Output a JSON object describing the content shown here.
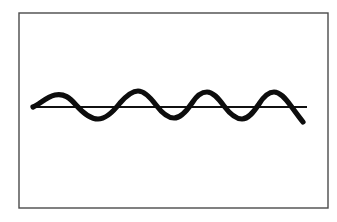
{
  "figure": {
    "title": "Sinusoidal wave crossing a horizontal axis",
    "caption": "",
    "background_color": "#ffffff"
  },
  "frame": {
    "name": "figure-border",
    "x": 19,
    "y": 13,
    "width": 309,
    "height": 195,
    "stroke_color": "#4a4a4a",
    "stroke_width": 1.4,
    "fill_color": "#ffffff"
  },
  "axis": {
    "name": "horizontal-baseline",
    "x_start": 33,
    "x_end": 307,
    "y": 107,
    "stroke_color": "#111111",
    "stroke_width": 2.2
  },
  "wave": {
    "name": "sine-wave-curve",
    "stroke_color": "#0d0d0d",
    "stroke_width": 5.2,
    "start_x": 33,
    "end_x": 303,
    "baseline_y": 107,
    "cycles": 4,
    "crest_count": 4,
    "trough_count": 4,
    "path": "M 33 107 C 40 104 46 97 55 95 C 64 93 70 98 76 105 C 83 113 90 119 98 119 C 106 119 113 112 120 103 C 127 95 132 91 138 91 C 144 91 150 97 156 105 C 162 113 168 118 174 118 C 180 118 186 112 192 103 C 197 95 202 92 207 92 C 213 92 218 98 224 106 C 230 114 236 119 242 119 C 248 119 253 113 259 104 C 264 96 269 92 274 92 C 280 92 285 98 291 106 C 296 113 300 118 303 122"
  },
  "chart_data": {
    "type": "line",
    "title": "Sinusoidal wave crossing a horizontal axis",
    "xlabel": "",
    "ylabel": "",
    "grid": false,
    "legend": "none",
    "xlim": [
      0,
      4.2
    ],
    "ylim": [
      -1.2,
      1.2
    ],
    "series": [
      {
        "name": "baseline",
        "style": "straight-line",
        "points": [
          {
            "x": 0.0,
            "y": 0
          },
          {
            "x": 4.2,
            "y": 0
          }
        ]
      },
      {
        "name": "wave",
        "style": "thick-freehand-sine",
        "crests": [
          {
            "x": 0.33,
            "y": 0.62
          },
          {
            "x": 1.6,
            "y": 0.78
          },
          {
            "x": 2.65,
            "y": 0.72
          },
          {
            "x": 3.7,
            "y": 0.72
          }
        ],
        "troughs": [
          {
            "x": 1.0,
            "y": -0.62
          },
          {
            "x": 2.05,
            "y": -0.58
          },
          {
            "x": 3.1,
            "y": -0.62
          },
          {
            "x": 4.1,
            "y": -0.72
          }
        ],
        "zero_crossings": [
          0.0,
          0.68,
          1.33,
          2.35,
          3.38,
          4.0
        ]
      }
    ]
  },
  "labels": {
    "none": ""
  }
}
